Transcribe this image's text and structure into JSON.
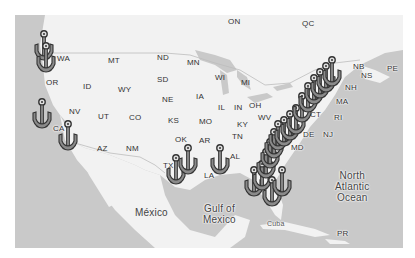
{
  "map": {
    "colors": {
      "land": "#f2f2f2",
      "water": "#c9c9c9",
      "anchor_fill": "#8a8a8a",
      "anchor_stroke": "#333333",
      "label": "#333333"
    },
    "country_labels": [
      {
        "id": "mexico",
        "text": "México"
      }
    ],
    "water_labels": [
      {
        "id": "gulf",
        "lines": [
          "Gulf of",
          "Mexico"
        ]
      },
      {
        "id": "atlantic",
        "lines": [
          "North",
          "Atlantic",
          "Ocean"
        ]
      }
    ],
    "island_labels": [
      {
        "id": "cuba",
        "text": "Cuba"
      },
      {
        "id": "pr",
        "text": "PR"
      }
    ],
    "province_labels": [
      {
        "id": "on",
        "text": "ON"
      },
      {
        "id": "qc",
        "text": "QC"
      },
      {
        "id": "nb",
        "text": "NB"
      },
      {
        "id": "ns",
        "text": "NS"
      },
      {
        "id": "pe",
        "text": "PE"
      }
    ],
    "state_labels": [
      {
        "id": "wa",
        "text": "WA"
      },
      {
        "id": "or",
        "text": "OR"
      },
      {
        "id": "ca",
        "text": "CA"
      },
      {
        "id": "id",
        "text": "ID"
      },
      {
        "id": "nv",
        "text": "NV"
      },
      {
        "id": "mt",
        "text": "MT"
      },
      {
        "id": "wy",
        "text": "WY"
      },
      {
        "id": "ut",
        "text": "UT"
      },
      {
        "id": "co",
        "text": "CO"
      },
      {
        "id": "az",
        "text": "AZ"
      },
      {
        "id": "nm",
        "text": "NM"
      },
      {
        "id": "nd",
        "text": "ND"
      },
      {
        "id": "sd",
        "text": "SD"
      },
      {
        "id": "ne",
        "text": "NE"
      },
      {
        "id": "ks",
        "text": "KS"
      },
      {
        "id": "ok",
        "text": "OK"
      },
      {
        "id": "tx",
        "text": "TX"
      },
      {
        "id": "mn",
        "text": "MN"
      },
      {
        "id": "ia",
        "text": "IA"
      },
      {
        "id": "mo",
        "text": "MO"
      },
      {
        "id": "ar",
        "text": "AR"
      },
      {
        "id": "la",
        "text": "LA"
      },
      {
        "id": "wi",
        "text": "WI"
      },
      {
        "id": "il",
        "text": "IL"
      },
      {
        "id": "mi",
        "text": "MI"
      },
      {
        "id": "in",
        "text": "IN"
      },
      {
        "id": "oh",
        "text": "OH"
      },
      {
        "id": "ky",
        "text": "KY"
      },
      {
        "id": "tn",
        "text": "TN"
      },
      {
        "id": "al",
        "text": "AL"
      },
      {
        "id": "wv",
        "text": "WV"
      },
      {
        "id": "md",
        "text": "MD"
      },
      {
        "id": "de",
        "text": "DE"
      },
      {
        "id": "nj",
        "text": "NJ"
      },
      {
        "id": "ct",
        "text": "CT"
      },
      {
        "id": "ri",
        "text": "RI"
      },
      {
        "id": "ma",
        "text": "MA"
      },
      {
        "id": "nh",
        "text": "NH"
      }
    ],
    "markers": {
      "icon": "anchor-icon",
      "count": 24
    }
  }
}
